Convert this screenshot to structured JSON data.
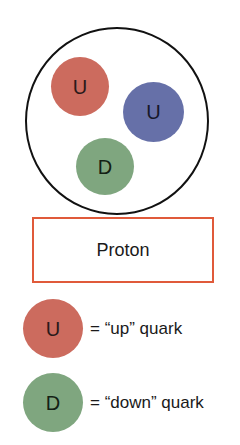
{
  "diagram": {
    "proton": {
      "outline_color": "#111111",
      "quarks": [
        {
          "label": "U",
          "type": "up",
          "color": "#cc6b5e"
        },
        {
          "label": "U",
          "type": "up",
          "color": "#6670a8"
        },
        {
          "label": "D",
          "type": "down",
          "color": "#7fa67f"
        }
      ]
    },
    "caption": {
      "label": "Proton",
      "border_color": "#e05a3a"
    },
    "legend": [
      {
        "symbol": "U",
        "color": "#cc6b5e",
        "text": "= “up” quark"
      },
      {
        "symbol": "D",
        "color": "#7fa67f",
        "text": "= “down” quark"
      }
    ]
  }
}
